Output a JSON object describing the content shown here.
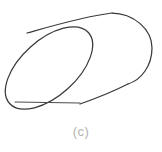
{
  "figure": {
    "caption": "(c)",
    "label_letter": "c",
    "kind": "line-drawing",
    "background_color": "#ffffff",
    "stroke_color": "#3a3a3a",
    "chord_color": "#4a4a4a",
    "caption_color": "#b4b4b4",
    "canvas": {
      "width": 162,
      "height": 152
    },
    "parts": [
      {
        "name": "left-end-cap-ellipse",
        "description": "tilted ellipse forming the near (front-left) opening of the tube",
        "center_x": 49,
        "center_y": 68,
        "radius_x": 53,
        "radius_y": 28,
        "rotation_deg": -42
      },
      {
        "name": "upper-silhouette-line",
        "description": "upper outline of the tube body running from the ellipse tangent to the far end",
        "start_x": 27,
        "start_y": 33,
        "end_x": 112,
        "end_y": 13
      },
      {
        "name": "lower-silhouette-line",
        "description": "lower outline of the tube body running from the ellipse tangent to the far end",
        "start_x": 80,
        "start_y": 104,
        "end_x": 128,
        "end_y": 84
      },
      {
        "name": "far-end-cap-arc",
        "description": "rounded right-hand far end of the tube",
        "apex_x": 152,
        "apex_y": 48
      },
      {
        "name": "chord-line",
        "description": "horizontal straight line across the lower part of the near ellipse",
        "start_x": 15,
        "start_y": 102,
        "end_x": 80,
        "end_y": 103
      }
    ]
  }
}
